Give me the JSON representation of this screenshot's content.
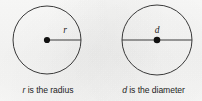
{
  "figure": {
    "background_color": "#fbfbfa",
    "stroke_color": "#3a3a3a",
    "text_color": "#232323"
  },
  "panels": [
    {
      "id": "radius-panel",
      "shape": "circle",
      "center": {
        "x": 47,
        "y": 40
      },
      "radius": 34,
      "center_dot": true,
      "segment": {
        "type": "radius",
        "from": {
          "x": 47,
          "y": 40
        },
        "to": {
          "x": 81,
          "y": 40
        }
      },
      "variable_label": "r",
      "variable_label_position": {
        "x": 65,
        "y": 31
      },
      "caption": {
        "variable": "r",
        "rest": " is the radius",
        "full": "r is the radius"
      }
    },
    {
      "id": "diameter-panel",
      "shape": "circle",
      "center": {
        "x": 157,
        "y": 40
      },
      "radius": 35,
      "center_dot": true,
      "segment": {
        "type": "diameter",
        "from": {
          "x": 122,
          "y": 40
        },
        "to": {
          "x": 192,
          "y": 40
        }
      },
      "variable_label": "d",
      "variable_label_position": {
        "x": 157,
        "y": 31
      },
      "caption": {
        "variable": "d",
        "rest": " is the diameter",
        "full": "d is the diameter"
      }
    }
  ]
}
